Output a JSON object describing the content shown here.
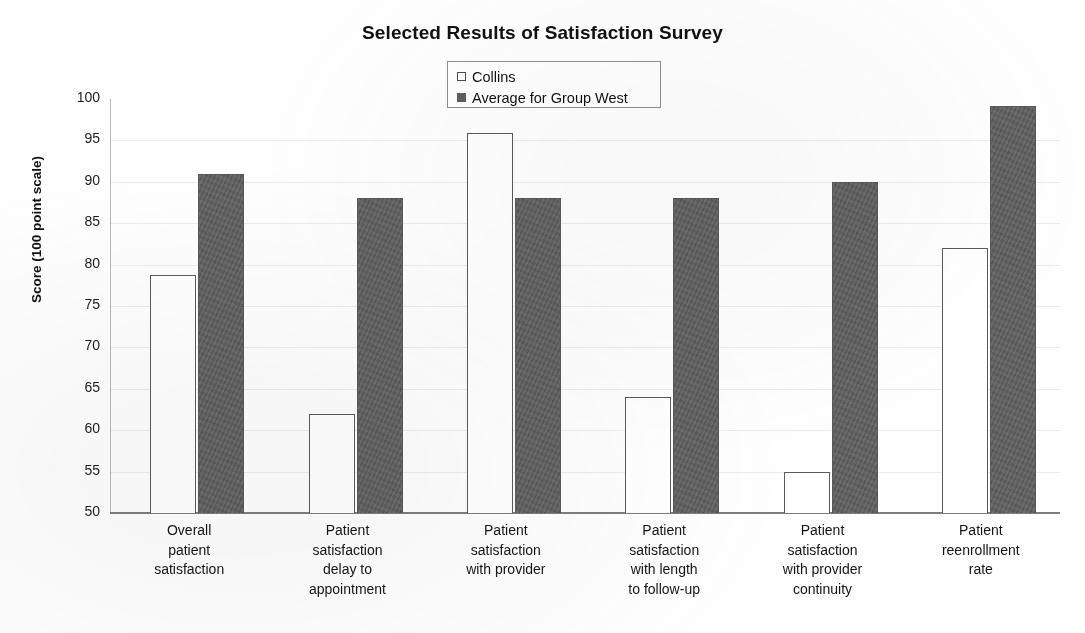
{
  "chart_data": {
    "type": "bar",
    "title": "Selected Results of Satisfaction Survey",
    "xlabel": "",
    "ylabel": "Score (100 point scale)",
    "ylim": [
      50,
      100
    ],
    "ytick_step": 5,
    "yticks": [
      100,
      95,
      90,
      85,
      80,
      75,
      70,
      65,
      60,
      55,
      50
    ],
    "grid": false,
    "legend_position": "top-center",
    "categories": [
      "Overall patient satisfaction",
      "Patient satisfaction delay to appointment",
      "Patient satisfaction with provider",
      "Patient satisfaction with length to follow-up",
      "Patient satisfaction with provider continuity",
      "Patient reenrollment rate"
    ],
    "category_lines": [
      [
        "Overall",
        "patient",
        "satisfaction"
      ],
      [
        "Patient",
        "satisfaction",
        "delay to",
        "appointment"
      ],
      [
        "Patient",
        "satisfaction",
        "with provider"
      ],
      [
        "Patient",
        "satisfaction",
        "with length",
        "to follow-up"
      ],
      [
        "Patient",
        "satisfaction",
        "with provider",
        "continuity"
      ],
      [
        "Patient",
        "reenrollment",
        "rate"
      ]
    ],
    "series": [
      {
        "name": "Collins",
        "color": "#ffffff",
        "border_color": "#5a5a5a",
        "values": [
          78.7,
          62.0,
          95.9,
          64.0,
          55.0,
          82.0
        ]
      },
      {
        "name": "Average for Group West",
        "color": "#5f5f5f",
        "border_color": "#595959",
        "values": [
          91.0,
          88.0,
          88.0,
          88.0,
          90.0,
          99.2
        ]
      }
    ]
  },
  "legend": {
    "items": [
      {
        "label": "Collins"
      },
      {
        "label": "Average for Group West"
      }
    ]
  }
}
